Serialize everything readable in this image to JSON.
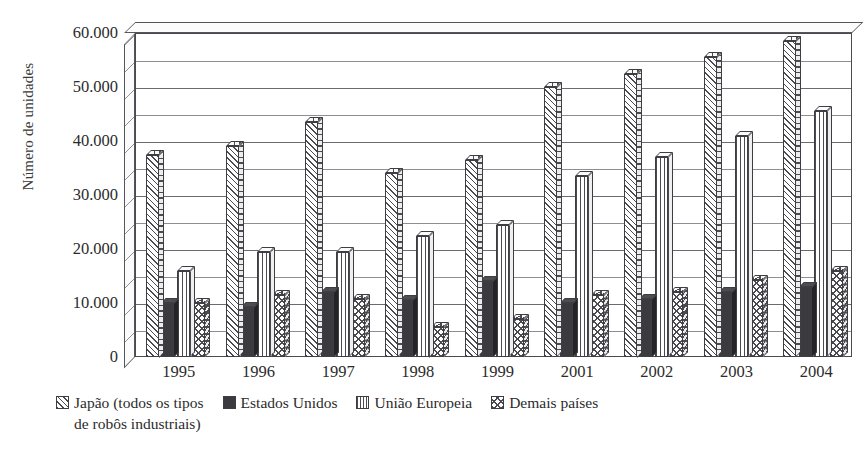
{
  "chart_data": {
    "type": "bar",
    "title": "",
    "xlabel": "",
    "ylabel": "Número de unidades",
    "ylim": [
      0,
      60000
    ],
    "yticks": [
      0,
      10000,
      20000,
      30000,
      40000,
      50000,
      60000
    ],
    "ytick_labels": [
      "0",
      "10.000",
      "20.000",
      "30.000",
      "40.000",
      "50.000",
      "60.000"
    ],
    "grid": true,
    "minor_gridlines_step": 5000,
    "legend_position": "bottom",
    "categories": [
      "1995",
      "1996",
      "1997",
      "1998",
      "1999",
      "2001",
      "2002",
      "2003",
      "2004"
    ],
    "series": [
      {
        "name": "Japão (todos os tipos de robôs industriais)",
        "pattern": "diagonal-hatch",
        "values": [
          37500,
          39000,
          43500,
          34000,
          36500,
          50000,
          52500,
          55500,
          58500
        ]
      },
      {
        "name": "Estados Unidos",
        "pattern": "solid-dark",
        "values": [
          10000,
          9300,
          12000,
          10500,
          14000,
          10000,
          10700,
          12000,
          13000
        ]
      },
      {
        "name": "União Europeia",
        "pattern": "vertical-lines",
        "values": [
          16000,
          19500,
          19500,
          22500,
          24500,
          33500,
          37000,
          41000,
          45500
        ]
      },
      {
        "name": "Demais países",
        "pattern": "cross-hatch",
        "values": [
          10000,
          11500,
          10800,
          5500,
          7000,
          11500,
          12000,
          14300,
          16000
        ]
      }
    ]
  },
  "axis": {
    "y_title": "Número de unidades"
  },
  "legend": {
    "items": [
      {
        "label": "Japão (todos os tipos",
        "label_cont": "de robôs industriais)",
        "swatch": "diagonal-hatch-swatch"
      },
      {
        "label": "Estados Unidos",
        "swatch": "solid-dark-swatch"
      },
      {
        "label": "União Europeia",
        "swatch": "vertical-lines-swatch"
      },
      {
        "label": "Demais países",
        "swatch": "cross-hatch-swatch"
      }
    ]
  },
  "colors": {
    "ink": "#2b2b2b",
    "line": "#4a4a50",
    "grid": "#8d8d93",
    "background": "#ffffff",
    "solid_fill": "#3a3a3f"
  }
}
